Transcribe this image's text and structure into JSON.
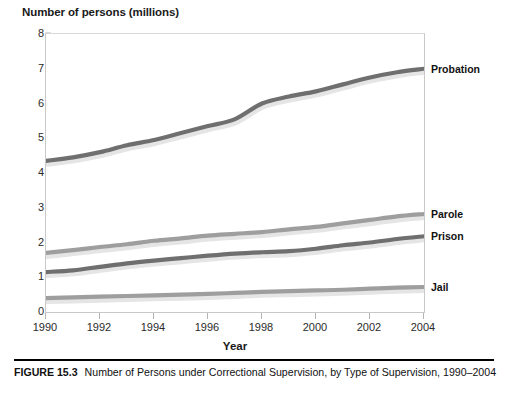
{
  "figure": {
    "caption_label": "FIGURE 15.3",
    "caption_text": "Number of Persons under Correctional Supervision, by Type of Supervision, 1990–2004"
  },
  "chart_data": {
    "type": "line",
    "title": "",
    "ylabel": "Number of persons (millions)",
    "xlabel": "Year",
    "xlim": [
      1990,
      2004
    ],
    "ylim": [
      0,
      8
    ],
    "ytick_labels": [
      "0",
      "1",
      "2",
      "3",
      "4",
      "5",
      "6",
      "7",
      "8"
    ],
    "yticks": [
      0,
      1,
      2,
      3,
      4,
      5,
      6,
      7,
      8
    ],
    "xtick_labels": [
      "1990",
      "1992",
      "1994",
      "1996",
      "1998",
      "2000",
      "2002",
      "2004"
    ],
    "xticks": [
      1990,
      1992,
      1994,
      1996,
      1998,
      2000,
      2002,
      2004
    ],
    "grid": false,
    "legend_position": "right-of-line-ends",
    "x": [
      1990,
      1991,
      1992,
      1993,
      1994,
      1995,
      1996,
      1997,
      1998,
      1999,
      2000,
      2001,
      2002,
      2003,
      2004
    ],
    "series": [
      {
        "name": "Probation",
        "color": "#6f6f6f",
        "label_value": 7.0,
        "values": [
          4.35,
          4.45,
          4.6,
          4.8,
          4.95,
          5.15,
          5.35,
          5.55,
          6.0,
          6.2,
          6.35,
          6.55,
          6.75,
          6.9,
          7.0
        ]
      },
      {
        "name": "Parole",
        "color": "#9e9e9e",
        "label_value": 2.82,
        "values": [
          1.7,
          1.78,
          1.87,
          1.95,
          2.05,
          2.12,
          2.2,
          2.25,
          2.3,
          2.38,
          2.45,
          2.55,
          2.65,
          2.75,
          2.82
        ]
      },
      {
        "name": "Prison",
        "color": "#6f6f6f",
        "label_value": 2.18,
        "values": [
          1.15,
          1.2,
          1.3,
          1.4,
          1.48,
          1.55,
          1.62,
          1.68,
          1.72,
          1.75,
          1.82,
          1.92,
          2.0,
          2.1,
          2.18
        ]
      },
      {
        "name": "Jail",
        "color": "#9e9e9e",
        "label_value": 0.72,
        "values": [
          0.4,
          0.42,
          0.44,
          0.46,
          0.48,
          0.5,
          0.52,
          0.55,
          0.58,
          0.6,
          0.62,
          0.64,
          0.67,
          0.7,
          0.72
        ]
      }
    ]
  }
}
